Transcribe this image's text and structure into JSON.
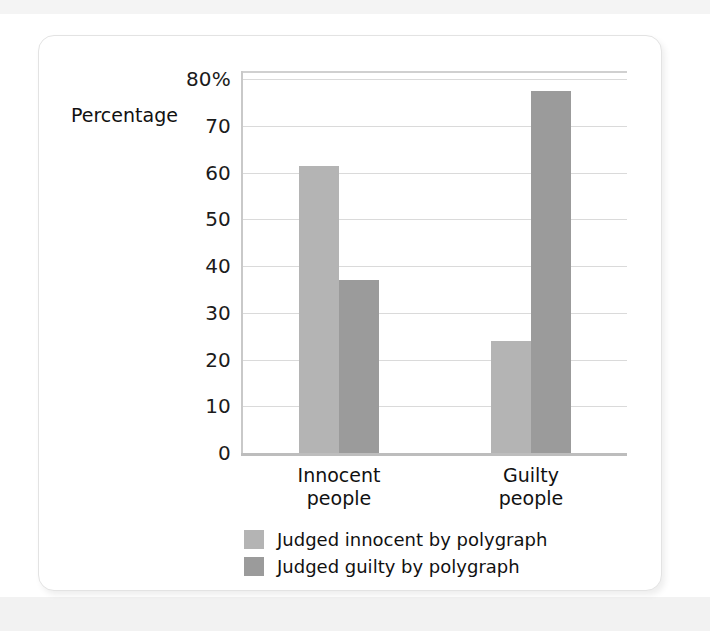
{
  "chart_data": {
    "type": "bar",
    "title": "",
    "xlabel": "",
    "ylabel": "Percentage",
    "categories": [
      "Innocent\npeople",
      "Guilty\npeople"
    ],
    "category_lines": [
      [
        "Innocent",
        "people"
      ],
      [
        "Guilty",
        "people"
      ]
    ],
    "series": [
      {
        "name": "Judged innocent by polygraph",
        "color": "#b4b4b4",
        "values": [
          61.5,
          24
        ]
      },
      {
        "name": "Judged guilty by polygraph",
        "color": "#9b9b9b",
        "values": [
          37,
          77.5
        ]
      }
    ],
    "ylim": [
      0,
      80
    ],
    "ytick_values": [
      0,
      10,
      20,
      30,
      40,
      50,
      60,
      70,
      80
    ],
    "ytick_labels": [
      "0",
      "10",
      "20",
      "30",
      "40",
      "50",
      "60",
      "70",
      "80%"
    ],
    "grid": true,
    "grid_color": "#dadada",
    "legend_position": "bottom-center"
  },
  "axis": {
    "y_title": "Percentage"
  },
  "legend": {
    "items": [
      {
        "label": "Judged innocent by polygraph"
      },
      {
        "label": "Judged guilty by polygraph"
      }
    ]
  }
}
